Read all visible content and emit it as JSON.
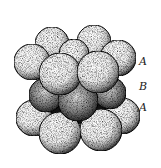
{
  "figure": {
    "labels": [
      {
        "text": "A",
        "x": 139,
        "y": 56
      },
      {
        "text": "B",
        "x": 139,
        "y": 81
      },
      {
        "text": "A",
        "x": 139,
        "y": 102
      }
    ],
    "colors": {
      "sphere_fill": "#f4f4f4",
      "shadow": "#111111",
      "stipple": "#333333",
      "label": "#222222"
    },
    "layers": {
      "top_A": [
        {
          "cx": 52,
          "cy": 44,
          "r": 17
        },
        {
          "cx": 94,
          "cy": 42,
          "r": 17
        },
        {
          "cx": 74,
          "cy": 54,
          "r": 15
        },
        {
          "cx": 32,
          "cy": 62,
          "r": 18
        },
        {
          "cx": 118,
          "cy": 58,
          "r": 18
        },
        {
          "cx": 60,
          "cy": 74,
          "r": 21
        },
        {
          "cx": 98,
          "cy": 72,
          "r": 21
        }
      ],
      "middle_B": [
        {
          "cx": 46,
          "cy": 95,
          "r": 17
        },
        {
          "cx": 110,
          "cy": 93,
          "r": 16
        },
        {
          "cx": 78,
          "cy": 101,
          "r": 20
        }
      ],
      "bottom_A": [
        {
          "cx": 34,
          "cy": 118,
          "r": 18
        },
        {
          "cx": 122,
          "cy": 116,
          "r": 18
        },
        {
          "cx": 60,
          "cy": 133,
          "r": 21
        },
        {
          "cx": 101,
          "cy": 130,
          "r": 21
        }
      ]
    }
  }
}
